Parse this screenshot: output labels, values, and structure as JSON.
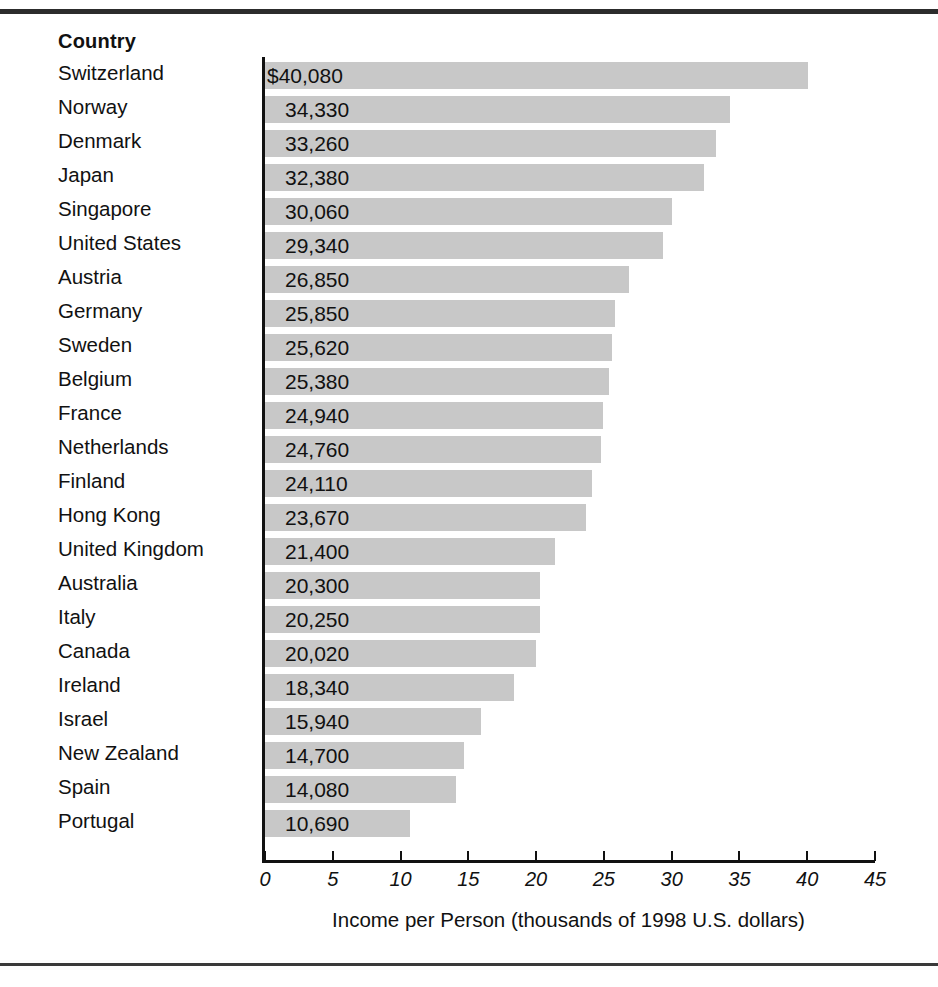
{
  "figure": {
    "column_header": "Country",
    "bar_color": "#c8c8c8",
    "axis_color": "#111111",
    "rule_color": "#2c2c2c"
  },
  "chart_data": {
    "type": "bar",
    "orientation": "horizontal",
    "title": "",
    "subtitle": "",
    "xlabel": "Income per Person (thousands of 1998 U.S. dollars)",
    "ylabel": "Country",
    "xlim": [
      0,
      45
    ],
    "xticks": [
      0,
      5,
      10,
      15,
      20,
      25,
      30,
      35,
      40,
      45
    ],
    "xtick_labels": [
      "0",
      "5",
      "10",
      "15",
      "20",
      "25",
      "30",
      "35",
      "40",
      "45"
    ],
    "grid": false,
    "legend": null,
    "value_unit": "thousands of 1998 U.S. dollars",
    "categories": [
      "Switzerland",
      "Norway",
      "Denmark",
      "Japan",
      "Singapore",
      "United States",
      "Austria",
      "Germany",
      "Sweden",
      "Belgium",
      "France",
      "Netherlands",
      "Finland",
      "Hong Kong",
      "United Kingdom",
      "Australia",
      "Italy",
      "Canada",
      "Ireland",
      "Israel",
      "New Zealand",
      "Spain",
      "Portugal"
    ],
    "values": [
      40.08,
      34.33,
      33.26,
      32.38,
      30.06,
      29.34,
      26.85,
      25.85,
      25.62,
      25.38,
      24.94,
      24.76,
      24.11,
      23.67,
      21.4,
      20.3,
      20.25,
      20.02,
      18.34,
      15.94,
      14.7,
      14.08,
      10.69
    ],
    "data_labels": [
      "$40,080",
      "34,330",
      "33,260",
      "32,380",
      "30,060",
      "29,340",
      "26,850",
      "25,850",
      "25,620",
      "25,380",
      "24,940",
      "24,760",
      "24,110",
      "23,670",
      "21,400",
      "20,300",
      "20,250",
      "20,020",
      "18,340",
      "15,940",
      "14,700",
      "14,080",
      "10,690"
    ]
  }
}
